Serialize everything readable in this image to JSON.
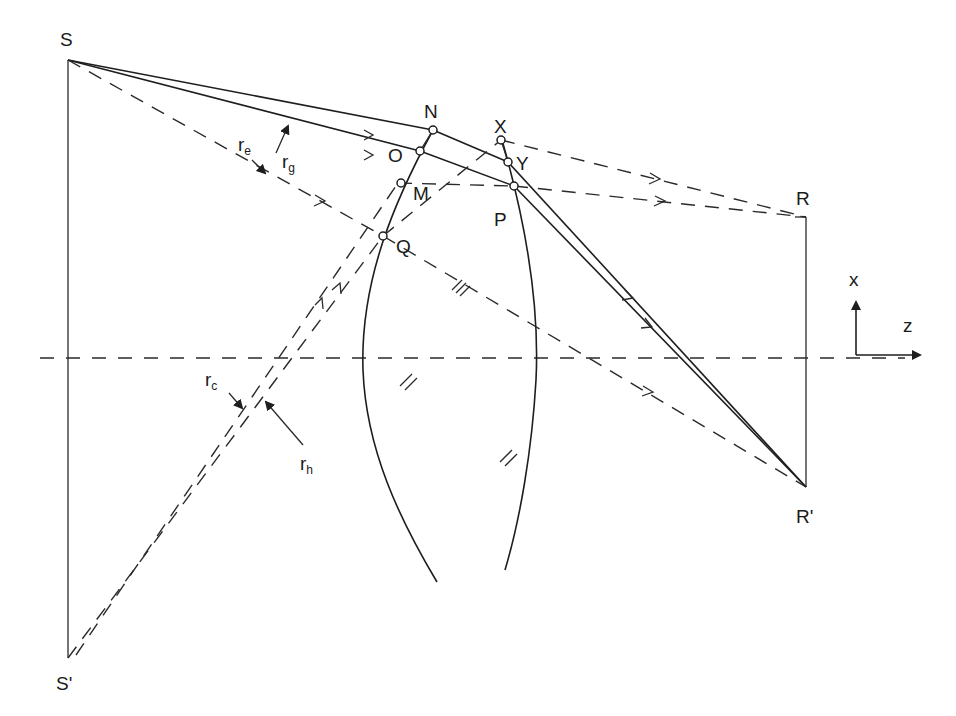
{
  "diagram": {
    "type": "ray-optics lens diagram",
    "points": {
      "S": "S",
      "S_prime": "S'",
      "R": "R",
      "R_prime": "R'",
      "N": "N",
      "O": "O",
      "M": "M",
      "Q": "Q",
      "X": "X",
      "Y": "Y",
      "P": "P"
    },
    "rays": {
      "re": {
        "main": "r",
        "sub": "e"
      },
      "rg": {
        "main": "r",
        "sub": "g"
      },
      "rc": {
        "main": "r",
        "sub": "c"
      },
      "rh": {
        "main": "r",
        "sub": "h"
      }
    },
    "axes": {
      "x": "x",
      "z": "z"
    },
    "colors": {
      "ink": "#1e1e1e",
      "background": "#ffffff"
    }
  }
}
